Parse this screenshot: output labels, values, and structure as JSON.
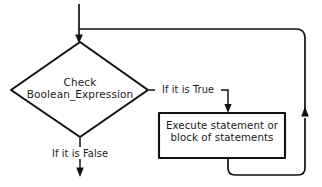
{
  "diagram": {
    "type": "flowchart",
    "background_color": "#ffffff",
    "stroke_color": "#111111",
    "nodes": [
      {
        "id": "decision",
        "shape": "diamond",
        "label_line1": "Check",
        "label_line2": "Boolean_Expression"
      },
      {
        "id": "process",
        "shape": "rectangle",
        "label_line1": "Execute statement or",
        "label_line2": "block of statements"
      }
    ],
    "edges": [
      {
        "id": "entry",
        "from": "start",
        "to": "decision",
        "label": ""
      },
      {
        "id": "true-branch",
        "from": "decision",
        "to": "process",
        "label": "If it is True"
      },
      {
        "id": "false-branch",
        "from": "decision",
        "to": "exit",
        "label": "If it is False"
      },
      {
        "id": "loop-back",
        "from": "process",
        "to": "decision",
        "label": ""
      }
    ]
  }
}
